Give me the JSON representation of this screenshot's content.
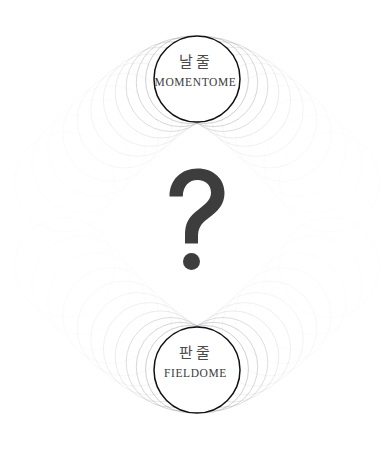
{
  "canvas": {
    "width": 391,
    "height": 453,
    "background_color": "#ffffff"
  },
  "palette": {
    "ink": "#111111",
    "faint_circle": "#8a8a96",
    "question_mark": "#3d3d3d",
    "korean_text": "#4a4a4a",
    "latin_text": "#3a3a3a"
  },
  "top_emblem": {
    "name": "momentome-emblem",
    "korean": "날줄",
    "latin": "MOMENTOME",
    "center_x": 197,
    "center_y": 79,
    "radius": 43
  },
  "bottom_emblem": {
    "name": "fieldome-emblem",
    "korean": "판줄",
    "latin": "FIELDOME",
    "center_x": 197,
    "center_y": 370,
    "radius": 43
  },
  "center_symbol": {
    "glyph": "?",
    "name": "question-mark",
    "center_x": 197,
    "center_y": 222
  },
  "echo_rings": {
    "count_per_side": 11,
    "description": "faint concentric circles fanning symmetrically outward from each emblem"
  }
}
